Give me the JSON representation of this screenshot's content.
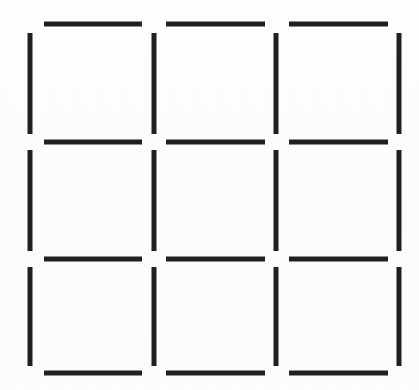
{
  "figure": {
    "canvas": {
      "width": 419,
      "height": 390
    },
    "background_color": "#fdfdfc",
    "line_color": "#1f2021",
    "line_thickness": 5,
    "rows": 3,
    "columns": 3,
    "cell_count": 9,
    "segment_count": 24,
    "horizontal_segment_count": 12,
    "vertical_segment_count": 12
  },
  "chart_data": {
    "type": "diagram",
    "grid": {
      "rows": 3,
      "columns": 3
    },
    "x_lines": [
      30,
      154,
      276,
      399
    ],
    "y_lines": [
      24,
      142,
      259,
      373
    ],
    "horizontal_segments": [
      {
        "id": "h-r1-c1",
        "row": 1,
        "col": 1,
        "x1": 44,
        "x2": 142,
        "y": 24
      },
      {
        "id": "h-r1-c2",
        "row": 1,
        "col": 2,
        "x1": 166,
        "x2": 265,
        "y": 24
      },
      {
        "id": "h-r1-c3",
        "row": 1,
        "col": 3,
        "x1": 289,
        "x2": 388,
        "y": 24
      },
      {
        "id": "h-r2-c1",
        "row": 2,
        "col": 1,
        "x1": 44,
        "x2": 142,
        "y": 142
      },
      {
        "id": "h-r2-c2",
        "row": 2,
        "col": 2,
        "x1": 166,
        "x2": 265,
        "y": 142
      },
      {
        "id": "h-r2-c3",
        "row": 2,
        "col": 3,
        "x1": 289,
        "x2": 388,
        "y": 142
      },
      {
        "id": "h-r3-c1",
        "row": 3,
        "col": 1,
        "x1": 44,
        "x2": 142,
        "y": 259
      },
      {
        "id": "h-r3-c2",
        "row": 3,
        "col": 2,
        "x1": 166,
        "x2": 265,
        "y": 259
      },
      {
        "id": "h-r3-c3",
        "row": 3,
        "col": 3,
        "x1": 289,
        "x2": 388,
        "y": 259
      },
      {
        "id": "h-r4-c1",
        "row": 4,
        "col": 1,
        "x1": 44,
        "x2": 142,
        "y": 373
      },
      {
        "id": "h-r4-c2",
        "row": 4,
        "col": 2,
        "x1": 166,
        "x2": 265,
        "y": 373
      },
      {
        "id": "h-r4-c3",
        "row": 4,
        "col": 3,
        "x1": 289,
        "x2": 388,
        "y": 373
      }
    ],
    "vertical_segments": [
      {
        "id": "v-c1-r1",
        "col": 1,
        "row": 1,
        "x": 30,
        "y1": 33,
        "y2": 134
      },
      {
        "id": "v-c2-r1",
        "col": 2,
        "row": 1,
        "x": 154,
        "y1": 33,
        "y2": 134
      },
      {
        "id": "v-c3-r1",
        "col": 3,
        "row": 1,
        "x": 276,
        "y1": 33,
        "y2": 134
      },
      {
        "id": "v-c4-r1",
        "col": 4,
        "row": 1,
        "x": 399,
        "y1": 33,
        "y2": 134
      },
      {
        "id": "v-c1-r2",
        "col": 1,
        "row": 2,
        "x": 30,
        "y1": 150,
        "y2": 251
      },
      {
        "id": "v-c2-r2",
        "col": 2,
        "row": 2,
        "x": 154,
        "y1": 150,
        "y2": 251
      },
      {
        "id": "v-c3-r2",
        "col": 3,
        "row": 2,
        "x": 276,
        "y1": 150,
        "y2": 251
      },
      {
        "id": "v-c4-r2",
        "col": 4,
        "row": 2,
        "x": 399,
        "y1": 150,
        "y2": 251
      },
      {
        "id": "v-c1-r3",
        "col": 1,
        "row": 3,
        "x": 30,
        "y1": 267,
        "y2": 366
      },
      {
        "id": "v-c2-r3",
        "col": 2,
        "row": 3,
        "x": 154,
        "y1": 267,
        "y2": 366
      },
      {
        "id": "v-c3-r3",
        "col": 3,
        "row": 3,
        "x": 276,
        "y1": 267,
        "y2": 366
      },
      {
        "id": "v-c4-r3",
        "col": 4,
        "row": 3,
        "x": 399,
        "y1": 267,
        "y2": 366
      }
    ]
  }
}
